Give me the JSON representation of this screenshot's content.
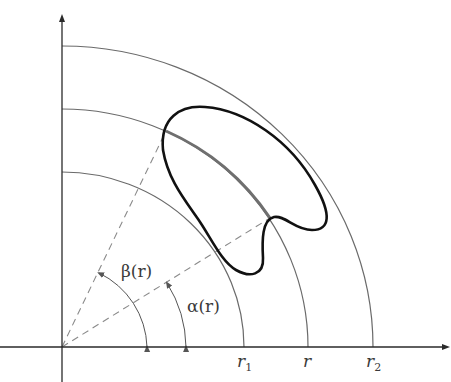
{
  "figure": {
    "colors": {
      "background": "#ffffff",
      "axis": "#2a2a2a",
      "arc": "#6a6a6a",
      "shape": "#111111",
      "highlight_arc": "#6f6f6f",
      "dashed": "#8a8a8a"
    },
    "origin": [
      62,
      347
    ],
    "axes": {
      "x_end": 450,
      "y_end": 14
    },
    "arcs": [
      {
        "name": "r1",
        "rx": 182,
        "ry": 175
      },
      {
        "name": "r",
        "rx": 246,
        "ry": 238
      },
      {
        "name": "r2",
        "rx": 311,
        "ry": 301
      }
    ],
    "labels": {
      "beta": "β(r)",
      "alpha": "α(r)",
      "r1_main": "r",
      "r1_sub": "1",
      "r_main": "r",
      "r2_main": "r",
      "r2_sub": "2"
    }
  }
}
